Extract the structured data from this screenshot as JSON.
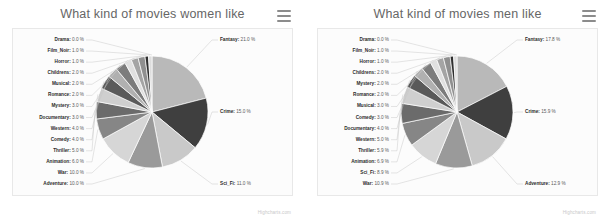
{
  "page": {
    "credit": "Highcharts.com",
    "menu_icon": "hamburger-menu-icon"
  },
  "charts": [
    {
      "id": "women",
      "title": "What kind of movies women like",
      "chart_data": {
        "type": "pie",
        "title": "What kind of movies women like",
        "xlabel": "",
        "ylabel": "",
        "legend": "none",
        "grid": false,
        "unit": "%",
        "categories": [
          "Fantasy",
          "Crime",
          "Sci_Fi",
          "Adventure",
          "War",
          "Animation",
          "Thriller",
          "Comedy",
          "Western",
          "Documentary",
          "Mystery",
          "Romance",
          "Musical",
          "Childrens",
          "Horror",
          "Film_Noir",
          "Drama"
        ],
        "values": [
          21.0,
          15.0,
          11.0,
          10.0,
          10.0,
          6.0,
          5.0,
          4.0,
          4.0,
          3.0,
          3.0,
          2.0,
          2.0,
          2.0,
          1.0,
          1.0,
          0.0
        ],
        "labels": [
          "Fantasy: 21.0 %",
          "Crime: 15.0 %",
          "Sci_Fi: 11.0 %",
          "Adventure: 10.0 %",
          "War: 10.0 %",
          "Animation: 6.0 %",
          "Thriller: 5.0 %",
          "Comedy: 4.0 %",
          "Western: 4.0 %",
          "Documentary: 3.0 %",
          "Mystery: 3.0 %",
          "Romance: 2.0 %",
          "Musical: 2.0 %",
          "Childrens: 2.0 %",
          "Horror: 1.0 %",
          "Film_Noir: 1.0 %",
          "Drama: 0.0 %"
        ]
      }
    },
    {
      "id": "men",
      "title": "What kind of movies men like",
      "chart_data": {
        "type": "pie",
        "title": "What kind of movies men like",
        "xlabel": "",
        "ylabel": "",
        "legend": "none",
        "grid": false,
        "unit": "%",
        "categories": [
          "Fantasy",
          "Crime",
          "Adventure",
          "War",
          "Sci_Fi",
          "Animation",
          "Thriller",
          "Western",
          "Documentary",
          "Comedy",
          "Musical",
          "Romance",
          "Mystery",
          "Childrens",
          "Horror",
          "Film_Noir",
          "Drama"
        ],
        "values": [
          17.8,
          15.9,
          12.9,
          10.9,
          8.9,
          6.9,
          5.9,
          5.0,
          4.0,
          3.0,
          3.0,
          2.0,
          2.0,
          2.0,
          1.0,
          1.0,
          0.0
        ],
        "labels": [
          "Fantasy: 17.8 %",
          "Crime: 15.9 %",
          "Adventure: 12.9 %",
          "War: 10.9 %",
          "Sci_Fi: 8.9 %",
          "Animation: 6.9 %",
          "Thriller: 5.9 %",
          "Western: 5.0 %",
          "Documentary: 4.0 %",
          "Comedy: 3.0 %",
          "Musical: 3.0 %",
          "Romance: 2.0 %",
          "Mystery: 2.0 %",
          "Childrens: 2.0 %",
          "Horror: 1.0 %",
          "Film_Noir: 1.0 %",
          "Drama: 0.0 %"
        ]
      }
    }
  ],
  "palette": [
    "#b9b9b9",
    "#3f3f3f",
    "#c9c9c9",
    "#9a9a9a",
    "#d6d6d6",
    "#868686",
    "#6b6b6b",
    "#cfcfcf",
    "#5a5a5a",
    "#b0b0b0",
    "#7c7c7c",
    "#e0e0e0",
    "#a4a4a4",
    "#8f8f8f",
    "#2f2f2f",
    "#dcdcdc",
    "#6f6f6f"
  ]
}
